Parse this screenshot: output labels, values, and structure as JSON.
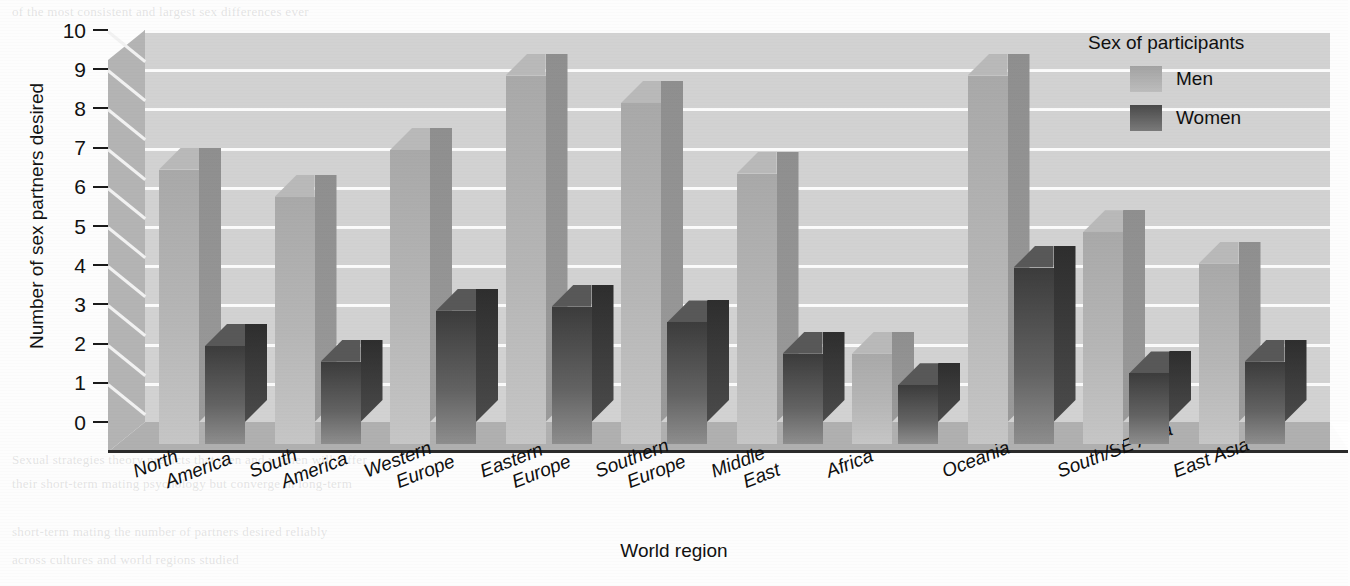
{
  "chart_data": {
    "type": "bar",
    "title": "",
    "xlabel": "World region",
    "ylabel": "Number of sex partners desired",
    "ylim": [
      0,
      10
    ],
    "yticks": [
      10,
      9,
      8,
      7,
      6,
      5,
      4,
      3,
      2,
      1,
      0
    ],
    "grid": true,
    "legend_position": "top-right",
    "legend_title": "Sex of participants",
    "categories": [
      [
        "North",
        "America"
      ],
      [
        "South",
        "America"
      ],
      [
        "Western",
        "Europe"
      ],
      [
        "Eastern",
        "Europe"
      ],
      [
        "Southern",
        "Europe"
      ],
      [
        "Middle",
        "East"
      ],
      [
        "Africa"
      ],
      [
        "Oceania"
      ],
      [
        "South/SE Asia"
      ],
      [
        "East Asia"
      ]
    ],
    "series": [
      {
        "name": "Men",
        "color": "#b4b4b4",
        "values": [
          7.0,
          6.3,
          7.5,
          9.4,
          8.7,
          6.9,
          2.3,
          9.4,
          5.4,
          4.6
        ]
      },
      {
        "name": "Women",
        "color": "#4d4d4d",
        "values": [
          2.5,
          2.1,
          3.4,
          3.5,
          3.1,
          2.3,
          1.5,
          4.5,
          1.8,
          2.1
        ]
      }
    ]
  },
  "axis": {
    "y_title": "Number of sex partners desired",
    "x_title": "World region"
  },
  "legend": {
    "title": "Sex of participants",
    "entries": [
      {
        "label": "Men"
      },
      {
        "label": "Women"
      }
    ]
  },
  "page_background_text": {
    "top": "printed page text behind figure",
    "lines": [
      "of the most consistent and largest sex differences ever",
      "Sexual strategies theory predicts that men and women will differ",
      "their short-term mating psychology but converge in long-term",
      "short-term mating the number of partners desired reliably",
      "across cultures and world regions studied"
    ]
  },
  "colors": {
    "plot_background": "#d2d2d2",
    "gridline": "#fbfbfb",
    "left_wall": "#b4b4b4",
    "floor": "#b0b0b0",
    "men_bar": "#b4b4b4",
    "women_bar": "#4d4d4d",
    "text": "#111111"
  }
}
